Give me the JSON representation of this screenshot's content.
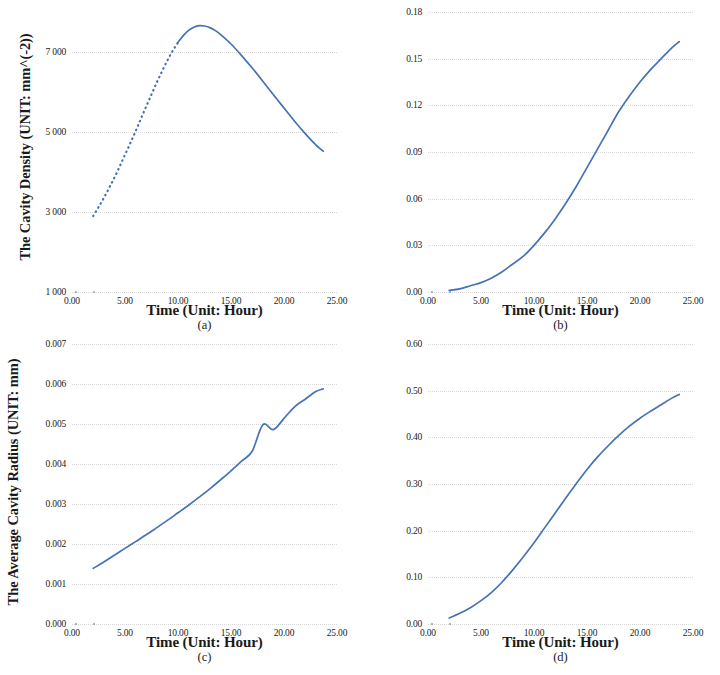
{
  "figure": {
    "background_color": "#ffffff",
    "curve_color": "#4573b5",
    "grid_color": "#d8d8d8",
    "panel_count": 4
  },
  "chart_data": [
    {
      "type": "line",
      "panel": "a",
      "sublabel": "(a)",
      "title": "",
      "ylabel": "The Cavity Density (UNIT: mm^(-2))",
      "xlabel": "Time (Unit: Hour)",
      "xticklabels": [
        "0.00",
        "5.00",
        "10.00",
        "15.00",
        "20.00",
        "25.00"
      ],
      "xticks": [
        0,
        5,
        10,
        15,
        20,
        25
      ],
      "yticklabels": [
        "1 000",
        "3 000",
        "5 000",
        "7 000"
      ],
      "yticks": [
        1000,
        3000,
        5000,
        7000
      ],
      "xlim": [
        0,
        25
      ],
      "ylim": [
        1000,
        8000
      ],
      "grid": true,
      "legend": "none",
      "marker_style": "dotted-then-solid",
      "x": [
        2.0,
        2.5,
        3.0,
        3.5,
        4.0,
        4.5,
        5.0,
        5.5,
        6.0,
        6.5,
        7.0,
        7.5,
        8.0,
        8.5,
        9.0,
        9.5,
        10.0,
        10.5,
        11.0,
        11.5,
        12.0,
        12.5,
        13.0,
        13.5,
        14.0,
        15.0,
        16.0,
        17.0,
        18.0,
        19.0,
        20.0,
        21.0,
        22.0,
        23.0,
        23.7
      ],
      "y": [
        2900,
        3120,
        3350,
        3600,
        3860,
        4140,
        4430,
        4720,
        5020,
        5330,
        5640,
        5940,
        6240,
        6520,
        6790,
        7030,
        7240,
        7410,
        7540,
        7620,
        7660,
        7650,
        7610,
        7540,
        7440,
        7200,
        6910,
        6600,
        6270,
        5930,
        5600,
        5270,
        4960,
        4680,
        4520
      ]
    },
    {
      "type": "line",
      "panel": "b",
      "sublabel": "(b)",
      "title": "",
      "ylabel": "The Damage Variable β",
      "xlabel": "Time (Unit: Hour)",
      "xticklabels": [
        "0.00",
        "5.00",
        "10.00",
        "15.00",
        "20.00",
        "25.00"
      ],
      "xticks": [
        0,
        5,
        10,
        15,
        20,
        25
      ],
      "yticklabels": [
        "0.00",
        "0.03",
        "0.06",
        "0.09",
        "0.12",
        "0.15",
        "0.18"
      ],
      "yticks": [
        0.0,
        0.03,
        0.06,
        0.09,
        0.12,
        0.15,
        0.18
      ],
      "xlim": [
        0,
        25
      ],
      "ylim": [
        0.0,
        0.18
      ],
      "grid": true,
      "legend": "none",
      "marker_style": "solid",
      "x": [
        2.0,
        3.0,
        4.0,
        5.0,
        6.0,
        7.0,
        8.0,
        9.0,
        10.0,
        11.0,
        12.0,
        13.0,
        14.0,
        15.0,
        16.0,
        17.0,
        18.0,
        19.0,
        20.0,
        21.0,
        22.0,
        23.0,
        23.7
      ],
      "y": [
        0.001,
        0.002,
        0.004,
        0.006,
        0.009,
        0.013,
        0.018,
        0.023,
        0.03,
        0.038,
        0.047,
        0.057,
        0.068,
        0.08,
        0.092,
        0.104,
        0.116,
        0.126,
        0.135,
        0.143,
        0.15,
        0.157,
        0.161
      ]
    },
    {
      "type": "line",
      "panel": "c",
      "sublabel": "(c)",
      "title": "",
      "ylabel": "The Average Cavity Radius (UNIT: mm)",
      "xlabel": "Time (Unit: Hour)",
      "xticklabels": [
        "0.00",
        "5.00",
        "10.00",
        "15.00",
        "20.00",
        "25.00"
      ],
      "xticks": [
        0,
        5,
        10,
        15,
        20,
        25
      ],
      "yticklabels": [
        "0.000",
        "0.001",
        "0.002",
        "0.003",
        "0.004",
        "0.005",
        "0.006",
        "0.007"
      ],
      "yticks": [
        0.0,
        0.001,
        0.002,
        0.003,
        0.004,
        0.005,
        0.006,
        0.007
      ],
      "xlim": [
        0,
        25
      ],
      "ylim": [
        0.0,
        0.007
      ],
      "grid": true,
      "legend": "none",
      "marker_style": "solid",
      "x": [
        2.0,
        3.0,
        4.0,
        5.0,
        6.0,
        7.0,
        8.0,
        9.0,
        10.0,
        11.0,
        12.0,
        13.0,
        14.0,
        15.0,
        16.0,
        17.0,
        18.0,
        19.0,
        20.0,
        21.0,
        22.0,
        23.0,
        23.7
      ],
      "y": [
        0.00139,
        0.00155,
        0.00172,
        0.00189,
        0.00206,
        0.00223,
        0.00241,
        0.00259,
        0.00278,
        0.00297,
        0.00317,
        0.00338,
        0.0036,
        0.00383,
        0.00407,
        0.00432,
        0.00498,
        0.00486,
        0.00514,
        0.00543,
        0.00562,
        0.00581,
        0.00588
      ]
    },
    {
      "type": "line",
      "panel": "d",
      "sublabel": "(d)",
      "title": "",
      "ylabel": "The Damage Area Fraction ω",
      "xlabel": "Time (Unit: Hour)",
      "xticklabels": [
        "0.00",
        "5.00",
        "10.00",
        "15.00",
        "20.00",
        "25.00"
      ],
      "xticks": [
        0,
        5,
        10,
        15,
        20,
        25
      ],
      "yticklabels": [
        "0.00",
        "0.10",
        "0.20",
        "0.30",
        "0.40",
        "0.50",
        "0.60"
      ],
      "yticks": [
        0.0,
        0.1,
        0.2,
        0.3,
        0.4,
        0.5,
        0.6
      ],
      "xlim": [
        0,
        25
      ],
      "ylim": [
        0.0,
        0.6
      ],
      "grid": true,
      "legend": "none",
      "marker_style": "solid",
      "x": [
        2.0,
        3.0,
        4.0,
        5.0,
        6.0,
        7.0,
        8.0,
        9.0,
        10.0,
        11.0,
        12.0,
        13.0,
        14.0,
        15.0,
        16.0,
        17.0,
        18.0,
        19.0,
        20.0,
        21.0,
        22.0,
        23.0,
        23.7
      ],
      "y": [
        0.013,
        0.023,
        0.035,
        0.05,
        0.068,
        0.09,
        0.116,
        0.144,
        0.174,
        0.206,
        0.238,
        0.27,
        0.301,
        0.331,
        0.358,
        0.382,
        0.404,
        0.424,
        0.441,
        0.456,
        0.47,
        0.484,
        0.492
      ]
    }
  ]
}
